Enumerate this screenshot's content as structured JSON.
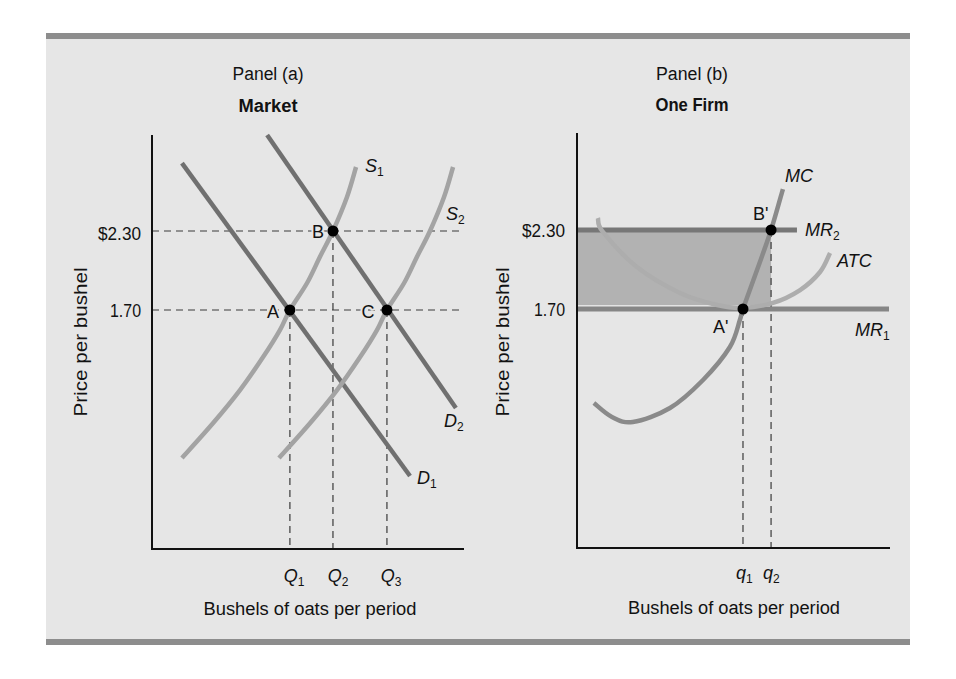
{
  "chart_data": [
    {
      "type": "line",
      "panel_label": "Panel (a)",
      "title": "Market",
      "xlabel": "Bushels of oats per period",
      "ylabel": "Price per bushel",
      "grid": false,
      "legend": "none",
      "xlim": [
        0,
        100
      ],
      "ylim": [
        0,
        3.1
      ],
      "y_ticks": [
        {
          "label": "$2.30",
          "value": 2.3
        },
        {
          "label": "1.70",
          "value": 1.7
        }
      ],
      "x_ticks": [
        {
          "label": "Q",
          "sub": "1",
          "value": 44.2
        },
        {
          "label": "Q",
          "sub": "2",
          "value": 58.0
        },
        {
          "label": "Q",
          "sub": "3",
          "value": 75.3
        }
      ],
      "h_guides": [
        2.3,
        1.7
      ],
      "h_guide_end": 99.7,
      "series": [
        {
          "name": "D1",
          "label": "D",
          "sub": "1",
          "kind": "demand",
          "color": "#707070",
          "points": [
            [
              9.6,
              2.816
            ],
            [
              82.7,
              0.439
            ]
          ]
        },
        {
          "name": "D2",
          "label": "D",
          "sub": "2",
          "kind": "demand",
          "color": "#707070",
          "points": [
            [
              36.9,
              3.029
            ],
            [
              97.4,
              0.956
            ]
          ]
        },
        {
          "name": "S1",
          "label": "S",
          "sub": "1",
          "kind": "supply",
          "color": "#a3a3a3",
          "points": [
            [
              9.6,
              0.576
            ],
            [
              19.6,
              0.842
            ],
            [
              28.2,
              1.092
            ],
            [
              35.6,
              1.343
            ],
            [
              41.0,
              1.548
            ],
            [
              44.2,
              1.7
            ],
            [
              49.7,
              1.905
            ],
            [
              53.8,
              2.103
            ],
            [
              58.0,
              2.3
            ],
            [
              62.5,
              2.558
            ],
            [
              65.4,
              2.786
            ]
          ]
        },
        {
          "name": "S2",
          "label": "S",
          "sub": "2",
          "kind": "supply",
          "color": "#a3a3a3",
          "points": [
            [
              40.7,
              0.576
            ],
            [
              50.7,
              0.842
            ],
            [
              59.3,
              1.092
            ],
            [
              66.7,
              1.343
            ],
            [
              72.1,
              1.548
            ],
            [
              75.3,
              1.7
            ],
            [
              80.8,
              1.905
            ],
            [
              84.9,
              2.103
            ],
            [
              89.1,
              2.3
            ],
            [
              93.6,
              2.558
            ],
            [
              96.5,
              2.786
            ]
          ]
        }
      ],
      "points": [
        {
          "label": "A",
          "x": 44.2,
          "y": 1.7
        },
        {
          "label": "B",
          "x": 58.0,
          "y": 2.3
        },
        {
          "label": "C",
          "x": 75.3,
          "y": 1.7
        }
      ]
    },
    {
      "type": "line",
      "panel_label": "Panel (b)",
      "title": "One Firm",
      "xlabel": "Bushels of oats per period",
      "ylabel": "Price per bushel",
      "grid": false,
      "legend": "none",
      "xlim": [
        0,
        100
      ],
      "ylim": [
        0,
        3.1
      ],
      "y_ticks": [
        {
          "label": "$2.30",
          "value": 2.3
        },
        {
          "label": "1.70",
          "value": 1.7
        }
      ],
      "x_ticks": [
        {
          "label": "q",
          "sub": "1",
          "value": 53.2
        },
        {
          "label": "q",
          "sub": "2",
          "value": 62.2
        }
      ],
      "h_guides": [],
      "shaded_area": {
        "x": [
          0,
          62.2
        ],
        "y": [
          1.73,
          2.3
        ],
        "color": "#b2b2b2"
      },
      "series": [
        {
          "name": "MR1",
          "label": "MR",
          "sub": "1",
          "kind": "revenue",
          "color": "#868686",
          "points": [
            [
              0,
              1.7
            ],
            [
              100,
              1.7
            ]
          ]
        },
        {
          "name": "MR2",
          "label": "MR",
          "sub": "2",
          "kind": "revenue",
          "color": "#777777",
          "points": [
            [
              0,
              2.3
            ],
            [
              70.5,
              2.3
            ]
          ]
        },
        {
          "name": "ATC",
          "label": "ATC",
          "sub": "",
          "kind": "cost",
          "color": "#adadad",
          "points": [
            [
              6.7,
              2.391
            ],
            [
              8.3,
              2.285
            ],
            [
              19.2,
              2.019
            ],
            [
              33.0,
              1.822
            ],
            [
              44.9,
              1.73
            ],
            [
              53.2,
              1.708
            ],
            [
              62.8,
              1.746
            ],
            [
              71.5,
              1.844
            ],
            [
              77.9,
              1.981
            ],
            [
              81.1,
              2.125
            ]
          ]
        },
        {
          "name": "MC",
          "label": "MC",
          "sub": "",
          "kind": "cost",
          "color": "#8a8a8a",
          "points": [
            [
              5.4,
              0.986
            ],
            [
              11.2,
              0.88
            ],
            [
              17.9,
              0.842
            ],
            [
              29.8,
              0.948
            ],
            [
              40.4,
              1.161
            ],
            [
              49.0,
              1.411
            ],
            [
              52.2,
              1.616
            ],
            [
              53.2,
              1.7
            ],
            [
              57.7,
              1.996
            ],
            [
              62.2,
              2.3
            ],
            [
              66.0,
              2.611
            ]
          ]
        }
      ],
      "points": [
        {
          "label": "A'",
          "x": 53.2,
          "y": 1.7
        },
        {
          "label": "B'",
          "x": 62.2,
          "y": 2.3
        }
      ]
    }
  ],
  "colors": {
    "background": "#e6e6e6",
    "rule": "#8d8d8d",
    "axis": "#111111",
    "point": "#000000"
  }
}
